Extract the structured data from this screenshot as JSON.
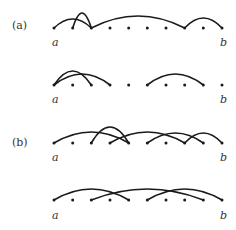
{
  "diagram": {
    "colors": {
      "stroke": "#1a1a1a",
      "text": "#333333",
      "background": "#ffffff"
    },
    "points_x": [
      54,
      72.7,
      91.3,
      110,
      128.7,
      147.3,
      166,
      184.7,
      203.3,
      222
    ],
    "panels": [
      {
        "label": "(a)",
        "label_y": 29
      },
      {
        "label": "(b)",
        "label_y": 146
      }
    ],
    "rows": [
      {
        "panel": "(a)",
        "y": 28,
        "endpoint_left": "a",
        "endpoint_right": "b",
        "arcs": [
          {
            "from": 0,
            "to": 2,
            "h": 9
          },
          {
            "from": 1,
            "to": 2,
            "h": 15
          },
          {
            "from": 2,
            "to": 7,
            "h": 12
          },
          {
            "from": 7,
            "to": 9,
            "h": 10
          }
        ]
      },
      {
        "panel": "(a)",
        "y": 85,
        "endpoint_left": "a",
        "endpoint_right": "b",
        "arcs": [
          {
            "from": 0,
            "to": 2,
            "h": 14
          },
          {
            "from": 0,
            "to": 3,
            "h": 11
          },
          {
            "from": 5,
            "to": 8,
            "h": 11
          }
        ]
      },
      {
        "panel": "(b)",
        "y": 143,
        "endpoint_left": "a",
        "endpoint_right": "b",
        "arcs": [
          {
            "from": 0,
            "to": 4,
            "h": 11
          },
          {
            "from": 2,
            "to": 4,
            "h": 16
          },
          {
            "from": 3,
            "to": 7,
            "h": 11
          },
          {
            "from": 5,
            "to": 8,
            "h": 10
          },
          {
            "from": 7,
            "to": 9,
            "h": 10
          }
        ]
      },
      {
        "panel": "(b)",
        "y": 200,
        "endpoint_left": "a",
        "endpoint_right": "b",
        "arcs": [
          {
            "from": 0,
            "to": 4,
            "h": 11
          },
          {
            "from": 2,
            "to": 8,
            "h": 11
          },
          {
            "from": 5,
            "to": 9,
            "h": 11
          }
        ]
      }
    ]
  }
}
